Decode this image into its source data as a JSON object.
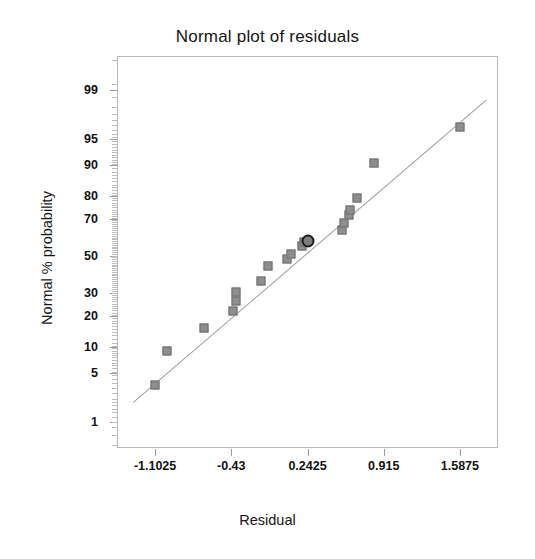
{
  "chart_data": {
    "type": "scatter",
    "title": "Normal plot of residuals",
    "xlabel": "Residual",
    "ylabel": "Normal % probability",
    "grid": false,
    "legend": null,
    "xlim": [
      -1.4386,
      1.9236
    ],
    "xticks": [
      -1.1025,
      -0.43,
      0.2425,
      0.915,
      1.5875
    ],
    "xticklabels": [
      "-1.1025",
      "-0.43",
      "0.2425",
      "0.915",
      "1.5875"
    ],
    "yscale": "normal-probability",
    "ylim": [
      0.35,
      99.75
    ],
    "yticks": [
      1,
      5,
      10,
      20,
      30,
      50,
      70,
      80,
      90,
      95,
      99
    ],
    "yticklabels": [
      "1",
      "5",
      "10",
      "20",
      "30",
      "50",
      "70",
      "80",
      "90",
      "95",
      "99"
    ],
    "y_minor_ticks": [
      0.5,
      2,
      3,
      40,
      60,
      98,
      99.5
    ],
    "reference_line": {
      "label": "normal reference line",
      "x_start": -1.3,
      "y_start": 2.0,
      "x_end": 1.82,
      "y_end": 98.6,
      "color": "#9c9c9c",
      "style": "solid"
    },
    "marker": {
      "shape": "square",
      "color": "#8e8e8e",
      "edge_color": "#6f6f6f",
      "size": 9
    },
    "highlight_marker": {
      "shape": "circle",
      "color": "#7d7d7d",
      "edge_color": "#1a1a1a",
      "size": 13
    },
    "points": [
      {
        "x": -1.1025,
        "y": 3.5,
        "highlighted": false
      },
      {
        "x": -1.0,
        "y": 9.0,
        "highlighted": false
      },
      {
        "x": -0.675,
        "y": 15.5,
        "highlighted": false
      },
      {
        "x": -0.415,
        "y": 22.0,
        "highlighted": false
      },
      {
        "x": -0.39,
        "y": 26.5,
        "highlighted": false
      },
      {
        "x": -0.385,
        "y": 30.5,
        "highlighted": false
      },
      {
        "x": -0.17,
        "y": 36.0,
        "highlighted": false
      },
      {
        "x": -0.11,
        "y": 44.5,
        "highlighted": false
      },
      {
        "x": 0.06,
        "y": 48.0,
        "highlighted": false
      },
      {
        "x": 0.1,
        "y": 51.0,
        "highlighted": false
      },
      {
        "x": 0.19,
        "y": 55.5,
        "highlighted": false
      },
      {
        "x": 0.215,
        "y": 58.0,
        "highlighted": false
      },
      {
        "x": 0.2425,
        "y": 58.5,
        "highlighted": true
      },
      {
        "x": 0.55,
        "y": 64.0,
        "highlighted": false
      },
      {
        "x": 0.565,
        "y": 68.0,
        "highlighted": false
      },
      {
        "x": 0.605,
        "y": 71.5,
        "highlighted": false
      },
      {
        "x": 0.615,
        "y": 74.0,
        "highlighted": false
      },
      {
        "x": 0.68,
        "y": 79.0,
        "highlighted": false
      },
      {
        "x": 0.83,
        "y": 90.5,
        "highlighted": false
      },
      {
        "x": 1.5875,
        "y": 96.5,
        "highlighted": false
      }
    ]
  }
}
